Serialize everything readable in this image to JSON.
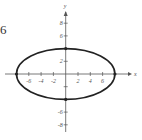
{
  "exercise_number": "6",
  "chart_data": {
    "type": "line",
    "title": "",
    "xlabel": "x",
    "ylabel": "y",
    "curve": "ellipse",
    "equation": "x^2/64 + y^2/16 = 1",
    "center": [
      0,
      0
    ],
    "semi_axes": {
      "a": 8,
      "b": 4
    },
    "marked_points": [
      [
        -8,
        0
      ],
      [
        8,
        0
      ],
      [
        0,
        4
      ],
      [
        0,
        -4
      ]
    ],
    "x_ticks": [
      -6,
      -4,
      -2,
      2,
      4,
      6
    ],
    "y_ticks": [
      8,
      6,
      2,
      -6,
      -8
    ],
    "x_tick_labels": [
      "-6",
      "-4",
      "-2",
      "2",
      "4",
      "6"
    ],
    "y_tick_labels": [
      "8",
      "6",
      "2",
      "-6",
      "-8"
    ],
    "xlim": [
      -9,
      10
    ],
    "ylim": [
      -9,
      10
    ],
    "grid": false,
    "legend": null
  },
  "colors": {
    "curve": "#222222",
    "axes": "#555555",
    "background": "#ffffff"
  }
}
